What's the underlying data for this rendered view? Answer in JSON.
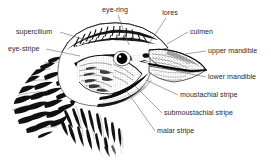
{
  "figure": {
    "background_color": "#ffffff",
    "ink_color": "#000000",
    "label_color": "#2a2a2a",
    "leader_color": "#5a5a5a",
    "width": 271,
    "height": 160
  },
  "labels": [
    {
      "id": "eye-ring",
      "text": "eye-ring",
      "anchor": "middle",
      "x": 115,
      "y": 12,
      "leader": "M 118 15 L 129 45"
    },
    {
      "id": "lores",
      "text": "lores",
      "anchor": "middle",
      "x": 170,
      "y": 15,
      "leader": "M 166 18 L 148 45"
    },
    {
      "id": "supercilium",
      "text": "supercilium",
      "anchor": "start",
      "x": 16,
      "y": 34,
      "leader": "M 60 32 L 92 42"
    },
    {
      "id": "culmen",
      "text": "culmen",
      "anchor": "start",
      "x": 190,
      "y": 34,
      "leader": "M 188 32 L 167 44"
    },
    {
      "id": "eye-stripe",
      "text": "eye-stripe",
      "anchor": "start",
      "x": 8,
      "y": 51,
      "leader": "M 46 49 L 80 56"
    },
    {
      "id": "upper-mandible",
      "text": "upper mandible",
      "anchor": "start",
      "x": 208,
      "y": 53,
      "leader": "M 206 51 L 185 54"
    },
    {
      "id": "lower-mandible",
      "text": "lower mandible",
      "anchor": "start",
      "x": 208,
      "y": 79,
      "leader": "M 206 77 L 176 71"
    },
    {
      "id": "moustachial-stripe",
      "text": "moustachial stripe",
      "anchor": "start",
      "x": 180,
      "y": 97,
      "leader": "M 178 95 L 146 80"
    },
    {
      "id": "submoustachial-stripe",
      "text": "submoustachial stripe",
      "anchor": "start",
      "x": 164,
      "y": 115,
      "leader": "M 162 113 L 135 86"
    },
    {
      "id": "malar-stripe",
      "text": "malar stripe",
      "anchor": "start",
      "x": 157,
      "y": 133,
      "leader": "M 155 131 L 126 90"
    }
  ]
}
